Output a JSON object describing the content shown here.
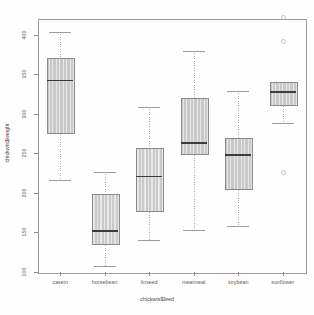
{
  "chart_data": {
    "type": "boxplot",
    "title": "",
    "xlabel": "chickwts$feed",
    "ylabel": "chickwts$weight",
    "ylim": [
      100,
      420
    ],
    "yticks": [
      100,
      150,
      200,
      250,
      300,
      350,
      400
    ],
    "ytick_labels": [
      "100",
      "150",
      "200",
      "250",
      "300",
      "350",
      "400"
    ],
    "grid": false,
    "legend": "none",
    "categories": [
      "casein",
      "horsebean",
      "linseed",
      "meatmeal",
      "soybean",
      "sunflower"
    ],
    "boxes": [
      {
        "category": "casein",
        "whisker_low": 216,
        "q1": 277,
        "median": 342,
        "q3": 371,
        "whisker_high": 404,
        "outliers": []
      },
      {
        "category": "horsebean",
        "whisker_low": 108,
        "q1": 137,
        "median": 152,
        "q3": 199,
        "whisker_high": 227,
        "outliers": []
      },
      {
        "category": "linseed",
        "whisker_low": 141,
        "q1": 178,
        "median": 221,
        "q3": 257,
        "whisker_high": 309,
        "outliers": []
      },
      {
        "category": "meatmeal",
        "whisker_low": 153,
        "q1": 250,
        "median": 263,
        "q3": 320,
        "whisker_high": 380,
        "outliers": []
      },
      {
        "category": "soybean",
        "whisker_low": 158,
        "q1": 206,
        "median": 248,
        "q3": 270,
        "whisker_high": 329,
        "outliers": []
      },
      {
        "category": "sunflower",
        "whisker_low": 289,
        "q1": 312,
        "median": 328,
        "q3": 340,
        "whisker_high": 340,
        "outliers": [
          226,
          392,
          423
        ]
      }
    ],
    "colors": {
      "box_fill": "#c9c9c9",
      "box_border": "#8a8a8a",
      "median": "#3b3b3b",
      "whisker": "#aeaeae",
      "outlier": "#c4c4c4",
      "frame": "#9a9a9a",
      "text": "#5b5b5b",
      "background": "#fefefe"
    }
  }
}
